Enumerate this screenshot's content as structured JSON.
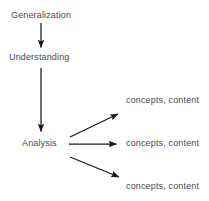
{
  "diagram": {
    "background_color": "#ffffff",
    "line_color": "#1a1a1a",
    "text_color": "#4a4a4a",
    "chain": [
      {
        "id": "generalization",
        "label": "Generalization"
      },
      {
        "id": "understanding",
        "label": "Understanding"
      },
      {
        "id": "analysis",
        "label": "Analysis"
      }
    ],
    "leaves": [
      {
        "id": "leaf-0",
        "label": "concepts, content"
      },
      {
        "id": "leaf-1",
        "label": "concepts, content"
      },
      {
        "id": "leaf-2",
        "label": "concepts, content"
      }
    ],
    "connectors": [
      {
        "id": "generalization-to-understanding",
        "kind": "arrow-down"
      },
      {
        "id": "understanding-to-analysis",
        "kind": "arrow-down"
      },
      {
        "id": "analysis-to-leaf-0",
        "kind": "arrow-diagonal-up"
      },
      {
        "id": "analysis-to-leaf-1",
        "kind": "arrow-right"
      },
      {
        "id": "analysis-to-leaf-2",
        "kind": "arrow-diagonal-down"
      }
    ]
  }
}
